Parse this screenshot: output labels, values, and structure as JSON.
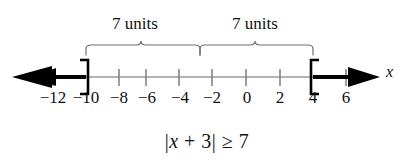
{
  "figure": {
    "type": "number-line-inequality-graph",
    "axis_variable_label": "x",
    "axis": {
      "min_label": -12,
      "max_label": 6,
      "tick_step": 2,
      "pixel_origin_x": 246,
      "pixel_per_unit": 16.65,
      "line_y": 77
    },
    "tick_labels": [
      {
        "value": -12,
        "text": "−12",
        "x": 53
      },
      {
        "value": -10,
        "text": "−10",
        "x": 86
      },
      {
        "value": -8,
        "text": "−8",
        "x": 119
      },
      {
        "value": -6,
        "text": "−6",
        "x": 146
      },
      {
        "value": -4,
        "text": "−4",
        "x": 179
      },
      {
        "value": -2,
        "text": "−2",
        "x": 212
      },
      {
        "value": 0,
        "text": "0",
        "x": 246
      },
      {
        "value": 2,
        "text": "2",
        "x": 280
      },
      {
        "value": 4,
        "text": "4",
        "x": 313
      },
      {
        "value": 6,
        "text": "6",
        "x": 346
      }
    ],
    "brackets": [
      {
        "name": "left-bracket",
        "value": -10,
        "x": 86,
        "glyph": "]",
        "direction": "closes-left",
        "inclusive": true
      },
      {
        "name": "right-bracket",
        "value": 4,
        "x": 313,
        "glyph": "[",
        "direction": "opens-right",
        "inclusive": true
      }
    ],
    "shaded_rays": [
      {
        "name": "left-ray",
        "from_value": -10,
        "to": "negative-infinity",
        "arrow": "left"
      },
      {
        "name": "right-ray",
        "from_value": 4,
        "to": "positive-infinity",
        "arrow": "right"
      }
    ],
    "braces": [
      {
        "name": "left-brace",
        "label": "7 units",
        "from_x": 86,
        "to_x": 200,
        "from_value": -10,
        "to_value": -3
      },
      {
        "name": "right-brace",
        "label": "7 units",
        "from_x": 200,
        "to_x": 313,
        "from_value": -3,
        "to_value": 4
      }
    ],
    "caption": {
      "full_text": "|x + 3| ≥ 7",
      "bar_open": "|",
      "variable": "x",
      "operator_plus": "+",
      "constant": "3",
      "bar_close": "|",
      "relation": "≥",
      "right_side": "7"
    },
    "colors": {
      "ink": "#111111",
      "line_light": "#8d8d8d",
      "line_bold": "#000000",
      "background": "#ffffff"
    }
  }
}
